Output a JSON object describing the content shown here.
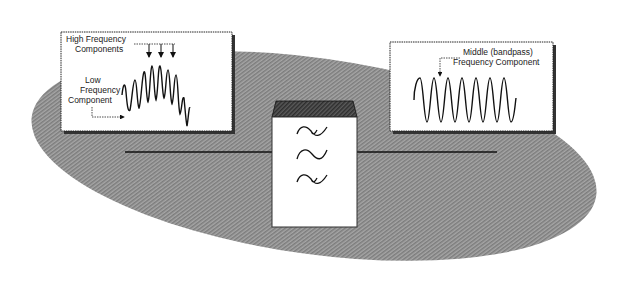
{
  "diagram": {
    "colors": {
      "background": "#ffffff",
      "ellipse_fill": "#9a9a9a",
      "box_fill": "#ffffff",
      "stroke": "#111111",
      "filter_top": "#4a4a4a",
      "shadow": "#3a3a3a"
    },
    "input_panel": {
      "labels": {
        "high_line1": "High Frequency",
        "high_line2": "Components",
        "low_line1": "Low",
        "low_line2": "Frequency",
        "low_line3": "Component"
      },
      "arrow_count": 3
    },
    "output_panel": {
      "labels": {
        "line1": "Middle (bandpass)",
        "line2": "Frequency  Component"
      },
      "cycles": 6
    },
    "filter_block": {
      "symbols": [
        "bandpass-wave-top",
        "sine-wave-middle",
        "bandpass-wave-bottom"
      ]
    }
  }
}
